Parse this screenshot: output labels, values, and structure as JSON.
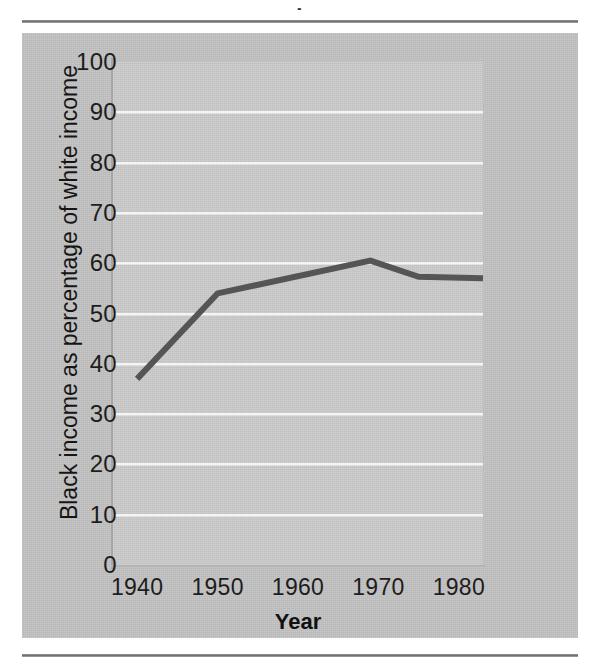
{
  "page": {
    "title_sliver": "▪",
    "rule_top": "horizontal-rule",
    "rule_bottom": "horizontal-rule"
  },
  "chart_data": {
    "type": "line",
    "title": "",
    "xlabel": "Year",
    "ylabel": "Black income as  percentage of white income",
    "xlim": [
      1937,
      1983
    ],
    "ylim": [
      0,
      100
    ],
    "grid": true,
    "legend": "none",
    "x_ticks": [
      "1940",
      "1950",
      "1960",
      "1970",
      "1980"
    ],
    "x_tick_values": [
      1940,
      1950,
      1960,
      1970,
      1980
    ],
    "y_ticks": [
      "0",
      "10",
      "20",
      "30",
      "40",
      "50",
      "60",
      "70",
      "80",
      "90",
      "100"
    ],
    "y_tick_values": [
      0,
      10,
      20,
      30,
      40,
      50,
      60,
      70,
      80,
      90,
      100
    ],
    "series": [
      {
        "name": "Black income as percentage of white income",
        "color": "#555555",
        "x": [
          1940,
          1950,
          1969,
          1975,
          1983
        ],
        "values": [
          37,
          54,
          60.5,
          57.3,
          57
        ]
      }
    ]
  },
  "colors": {
    "panel_gray": "#c2c2c2",
    "plot_gray": "#cacaca",
    "gridline": "#f4f4f4",
    "line": "#555555",
    "text": "#1d1d1d"
  }
}
